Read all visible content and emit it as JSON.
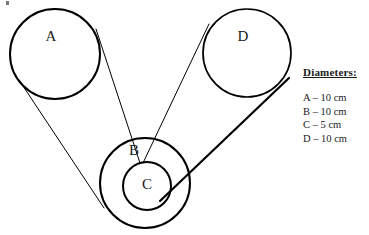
{
  "diagram": {
    "background_color": "#ffffff",
    "stroke_color": "#000000",
    "pulleys": [
      {
        "id": "A",
        "label": "A",
        "cx": 55,
        "cy": 54,
        "r": 45,
        "stroke_width": 2.0,
        "label_x": 51,
        "label_y": 38
      },
      {
        "id": "D",
        "label": "D",
        "cx": 247,
        "cy": 53,
        "r": 44,
        "stroke_width": 1.7,
        "label_x": 243,
        "label_y": 38
      },
      {
        "id": "B",
        "label": "B",
        "cx": 145,
        "cy": 183,
        "r": 45,
        "stroke_width": 2.0,
        "label_x": 134,
        "label_y": 152
      },
      {
        "id": "C",
        "label": "C",
        "cx": 147,
        "cy": 186,
        "r": 24,
        "stroke_width": 2.0,
        "label_x": 147,
        "label_y": 186
      }
    ],
    "belts": [
      {
        "id": "belt-a-to-c-upper",
        "from": "A",
        "to": "C",
        "x1": 96,
        "y1": 29,
        "x2": 140,
        "y2": 163,
        "stroke_width": 1.0
      },
      {
        "id": "belt-a-to-b-lower",
        "from": "A",
        "to": "B",
        "x1": 21,
        "y1": 83,
        "x2": 104,
        "y2": 208,
        "stroke_width": 1.0
      },
      {
        "id": "belt-d-to-c-upper",
        "from": "D",
        "to": "C",
        "x1": 209,
        "y1": 24,
        "x2": 143,
        "y2": 163,
        "stroke_width": 1.0
      },
      {
        "id": "belt-d-to-c-lower",
        "from": "D",
        "to": "C",
        "x1": 289,
        "y1": 78,
        "x2": 160,
        "y2": 201,
        "stroke_width": 2.2
      }
    ]
  },
  "legend": {
    "title": "Diameters:",
    "items": [
      "A – 10 cm",
      "B – 10 cm",
      "C – 5 cm",
      "D – 10 cm"
    ]
  }
}
